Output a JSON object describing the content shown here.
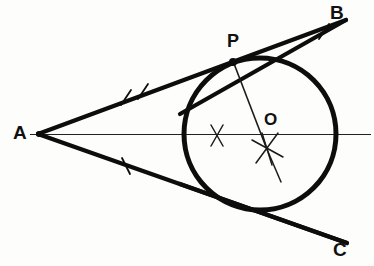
{
  "figure": {
    "background_color": "#fdfdfb",
    "ink_color": "#111111",
    "labels": {
      "vertex": "A",
      "ray_upper_end": "B",
      "ray_lower_end": "C",
      "tangent_point": "P",
      "circle_center": "O"
    },
    "geometry": {
      "vertex_point": {
        "x": 38,
        "y": 134
      },
      "ray_AB_end": {
        "x": 346,
        "y": 20
      },
      "ray_AC_end": {
        "x": 347,
        "y": 243
      },
      "axis_line": {
        "x1": 30,
        "y1": 134,
        "x2": 371,
        "y2": 134
      },
      "circle": {
        "cx": 260,
        "cy": 134,
        "r": 76
      },
      "tangent_point_P": {
        "x": 233,
        "y": 61
      },
      "tangent_point_lower": {
        "x": 225,
        "y": 202
      },
      "radius_line": {
        "x1": 233,
        "y1": 61,
        "x2": 266,
        "y2": 146
      },
      "construction_mark_left": {
        "x": 217,
        "y": 135
      },
      "construction_mark_center": {
        "x": 267,
        "y": 148
      },
      "tick_marks_AB": [
        {
          "x": 126,
          "y": 98
        },
        {
          "x": 143,
          "y": 92
        }
      ],
      "tick_marks_AC": [
        {
          "x": 126,
          "y": 166
        }
      ],
      "tick_marks_PB": [
        {
          "x": 324,
          "y": 31
        }
      ]
    },
    "stroke_widths": {
      "ray": 4.2,
      "circle": 5.0,
      "axis": 1.2,
      "radius": 1.6,
      "tick": 1.6,
      "construction": 1.5
    }
  }
}
